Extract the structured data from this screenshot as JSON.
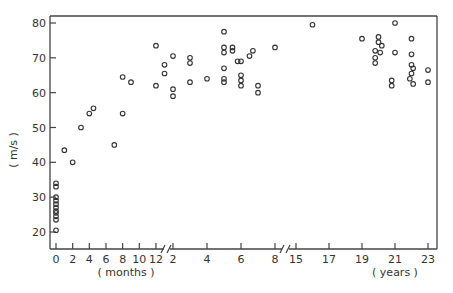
{
  "chart_data": {
    "type": "scatter",
    "title": "",
    "ylabel": "( m/s )",
    "xlabel_segments": [
      "( months )",
      "( years )"
    ],
    "ylim": [
      16,
      82
    ],
    "yticks": [
      20,
      30,
      40,
      50,
      60,
      70,
      80
    ],
    "grid": false,
    "legend": null,
    "x_axis": {
      "broken": true,
      "segments": [
        {
          "unit": "months",
          "ticks": [
            0,
            2,
            4,
            6,
            8,
            10,
            12
          ]
        },
        {
          "unit": "years",
          "ticks": [
            2,
            4,
            6,
            8
          ]
        },
        {
          "unit": "years",
          "ticks": [
            15,
            17,
            19,
            21,
            23
          ]
        }
      ]
    },
    "series": [
      {
        "name": "months",
        "unit": "months",
        "points": [
          [
            0,
            20.5
          ],
          [
            0,
            23.5
          ],
          [
            0,
            24.5
          ],
          [
            0,
            25.5
          ],
          [
            0,
            26
          ],
          [
            0,
            27
          ],
          [
            0,
            28
          ],
          [
            0,
            29
          ],
          [
            0,
            30
          ],
          [
            0,
            33
          ],
          [
            0,
            34
          ],
          [
            1,
            43.5
          ],
          [
            2,
            40
          ],
          [
            3,
            50
          ],
          [
            4,
            54
          ],
          [
            4.5,
            55.5
          ],
          [
            7,
            45
          ],
          [
            8,
            54
          ],
          [
            8,
            64.5
          ],
          [
            9,
            63
          ],
          [
            12,
            73.5
          ],
          [
            12,
            62
          ]
        ]
      },
      {
        "name": "years_2_to_8",
        "unit": "years",
        "points": [
          [
            1.5,
            68
          ],
          [
            1.5,
            65.5
          ],
          [
            2,
            70.5
          ],
          [
            2,
            61
          ],
          [
            2,
            59
          ],
          [
            3,
            70
          ],
          [
            3,
            68.5
          ],
          [
            3,
            63
          ],
          [
            4,
            64
          ],
          [
            5,
            77.5
          ],
          [
            5,
            73
          ],
          [
            5,
            71.5
          ],
          [
            5,
            67
          ],
          [
            5,
            63
          ],
          [
            5,
            64
          ],
          [
            5.5,
            73
          ],
          [
            5.5,
            72
          ],
          [
            5.8,
            69
          ],
          [
            6,
            69
          ],
          [
            6,
            65
          ],
          [
            6,
            63.5
          ],
          [
            6,
            62
          ],
          [
            6.5,
            70.5
          ],
          [
            6.7,
            72
          ],
          [
            7,
            60
          ],
          [
            7,
            62
          ],
          [
            8,
            73
          ]
        ]
      },
      {
        "name": "years_15_to_23",
        "unit": "years",
        "points": [
          [
            16,
            79.5
          ],
          [
            19,
            75.5
          ],
          [
            20,
            76
          ],
          [
            20,
            74.5
          ],
          [
            20.2,
            73.5
          ],
          [
            19.8,
            72
          ],
          [
            20.1,
            71.5
          ],
          [
            19.8,
            70
          ],
          [
            19.8,
            68.5
          ],
          [
            21,
            80
          ],
          [
            21,
            71.5
          ],
          [
            20.8,
            63.5
          ],
          [
            20.8,
            62
          ],
          [
            22,
            75.5
          ],
          [
            22,
            71
          ],
          [
            22,
            68
          ],
          [
            22.1,
            67
          ],
          [
            22,
            65.5
          ],
          [
            21.9,
            64
          ],
          [
            22.1,
            62.5
          ],
          [
            23,
            66.5
          ],
          [
            23,
            63
          ]
        ]
      }
    ]
  }
}
